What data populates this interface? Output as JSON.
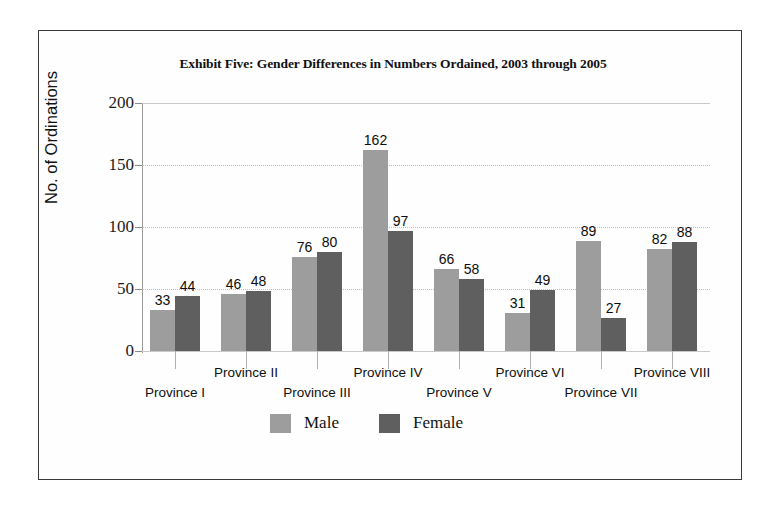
{
  "figure": {
    "frame_border_color": "#3a3a3a",
    "background_color": "#ffffff"
  },
  "chart_data": {
    "type": "bar",
    "title": "Exhibit Five: Gender Differences in Numbers Ordained, 2003 through 2005",
    "xlabel": "",
    "ylabel": "No. of Ordinations",
    "ylim": [
      0,
      200
    ],
    "yticks": [
      0,
      50,
      100,
      150,
      200
    ],
    "ytick_labels": [
      "0",
      "50",
      "100",
      "150",
      "200"
    ],
    "grid": true,
    "grid_axis": "y",
    "legend_position": "bottom-center",
    "categories": [
      "Province I",
      "Province II",
      "Province III",
      "Province IV",
      "Province V",
      "Province VI",
      "Province VII",
      "Province VIII"
    ],
    "series": [
      {
        "name": "Male",
        "color": "#9d9d9d",
        "values": [
          33,
          46,
          76,
          162,
          66,
          31,
          89,
          82
        ]
      },
      {
        "name": "Female",
        "color": "#5f5f5f",
        "values": [
          44,
          48,
          80,
          97,
          58,
          49,
          27,
          88
        ]
      }
    ],
    "data_labels": {
      "Male": [
        "33",
        "46",
        "76",
        "162",
        "66",
        "31",
        "89",
        "82"
      ],
      "Female": [
        "44",
        "48",
        "80",
        "97",
        "58",
        "49",
        "27",
        "88"
      ]
    }
  },
  "legend": {
    "items": [
      {
        "label": "Male",
        "color": "#9d9d9d"
      },
      {
        "label": "Female",
        "color": "#5f5f5f"
      }
    ]
  }
}
